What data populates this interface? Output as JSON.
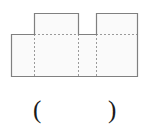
{
  "figure": {
    "name": "rectangle-with-two-tabs-net",
    "colors": {
      "outline": "#808080",
      "fill": "#fafafa",
      "fold_line": "#9a9a9a",
      "text": "#1a1a1a",
      "background": "#ffffff"
    },
    "base_rectangle": {
      "label": "base-rectangle",
      "x": 11,
      "y": 34,
      "width": 127,
      "height": 43
    },
    "tabs": [
      {
        "label": "left-tab",
        "x": 34,
        "y": 13,
        "width": 44,
        "height": 21
      },
      {
        "label": "right-tab",
        "x": 96,
        "y": 13,
        "width": 42,
        "height": 21
      }
    ],
    "fold_lines_vertical": [
      {
        "label": "fold-line-1",
        "x": 34,
        "y1": 34,
        "y2": 77
      },
      {
        "label": "fold-line-2",
        "x": 78,
        "y1": 34,
        "y2": 77
      },
      {
        "label": "fold-line-3",
        "x": 96,
        "y1": 34,
        "y2": 77
      }
    ],
    "fold_lines_horizontal": [
      {
        "label": "fold-line-top-left",
        "y": 34,
        "x1": 34,
        "x2": 78
      },
      {
        "label": "fold-line-top-right",
        "y": 34,
        "x1": 96,
        "x2": 138
      }
    ]
  },
  "answer": {
    "open_paren": "(",
    "close_paren": ")",
    "blank_value": ""
  }
}
